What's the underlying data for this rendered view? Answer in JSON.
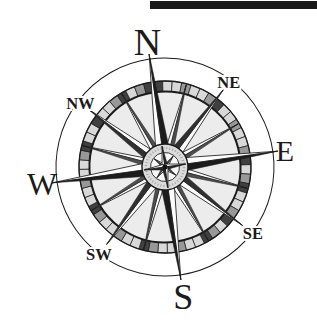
{
  "page": {
    "background_color": "#ffffff"
  },
  "top_bar": {
    "color": "#191919"
  },
  "compass": {
    "icon": "compass-rose",
    "ink_color": "#1b1b1b",
    "paper_color": "#ffffff",
    "ring_light": "#d8d8d8",
    "ring_mid": "#989898",
    "ring_dark": "#404040",
    "disc_color": "#ececec",
    "medallion_color": "#dcdcdc",
    "rotation_deg": -8,
    "directions": [
      {
        "label": "N",
        "bearing": 0,
        "kind": "cardinal"
      },
      {
        "label": "NE",
        "bearing": 45,
        "kind": "ordinal"
      },
      {
        "label": "E",
        "bearing": 90,
        "kind": "cardinal"
      },
      {
        "label": "SE",
        "bearing": 135,
        "kind": "ordinal"
      },
      {
        "label": "S",
        "bearing": 180,
        "kind": "cardinal"
      },
      {
        "label": "SW",
        "bearing": 225,
        "kind": "ordinal"
      },
      {
        "label": "W",
        "bearing": 270,
        "kind": "cardinal"
      },
      {
        "label": "NW",
        "bearing": 315,
        "kind": "ordinal"
      }
    ]
  }
}
